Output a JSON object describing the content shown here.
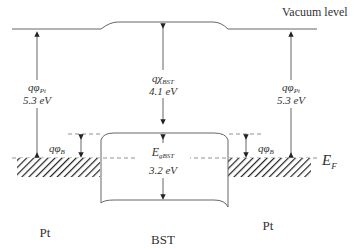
{
  "diagram": {
    "vacuum_level_label": "Vacuum level",
    "fermi_level_label": {
      "main": "E",
      "sub": "F"
    },
    "left_metal_label": "Pt",
    "right_metal_label": "Pt",
    "insulator_label": "BST",
    "left_work_function": {
      "symbol": "qφ",
      "sub": "Pt",
      "value": "5.3 eV"
    },
    "right_work_function": {
      "symbol": "qφ",
      "sub": "Pt",
      "value": "5.3 eV"
    },
    "electron_affinity": {
      "symbol": "qχ",
      "sub": "BST",
      "value": "4.1 eV"
    },
    "band_gap": {
      "symbol": "E",
      "sub": "gBST",
      "value": "3.2 eV"
    },
    "left_barrier": {
      "symbol": "qφ",
      "sub": "B"
    },
    "right_barrier": {
      "symbol": "qφ",
      "sub": "B"
    },
    "line_color": "#555555",
    "text_color": "#333333"
  }
}
